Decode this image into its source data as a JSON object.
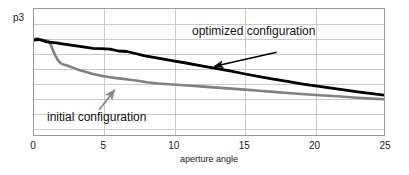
{
  "chart_data": {
    "type": "line",
    "title": "",
    "xlabel": "aperture angle",
    "ylabel": "p3",
    "xlim": [
      0,
      25
    ],
    "ylim": [
      0,
      1
    ],
    "xticks": [
      0,
      5,
      10,
      15,
      20,
      25
    ],
    "xticklabels": [
      "0",
      "5",
      "10",
      "15",
      "20",
      "25"
    ],
    "yticklabels": [],
    "grid": "both",
    "legend": "annotations-with-arrows",
    "series": [
      {
        "name": "optimized configuration",
        "color": "#000000",
        "x": [
          0.0,
          0.3,
          0.6,
          0.9,
          1.2,
          1.6,
          2.0,
          2.5,
          3.0,
          3.6,
          4.2,
          4.8,
          5.4,
          6.0,
          6.6,
          7.2,
          7.8,
          8.5,
          9.2,
          10.0,
          10.8,
          11.6,
          12.4,
          13.2,
          14.0,
          15.0,
          16.0,
          17.0,
          18.0,
          19.0,
          20.0,
          21.0,
          22.0,
          23.0,
          24.0,
          25.0
        ],
        "y": [
          0.756,
          0.762,
          0.755,
          0.744,
          0.74,
          0.735,
          0.728,
          0.72,
          0.712,
          0.702,
          0.693,
          0.69,
          0.686,
          0.672,
          0.668,
          0.652,
          0.636,
          0.622,
          0.608,
          0.592,
          0.578,
          0.562,
          0.546,
          0.53,
          0.514,
          0.492,
          0.472,
          0.452,
          0.434,
          0.416,
          0.4,
          0.384,
          0.368,
          0.352,
          0.338,
          0.326
        ]
      },
      {
        "name": "initial configuration",
        "color": "#808080",
        "x": [
          0.0,
          0.2,
          0.4,
          0.6,
          0.8,
          1.0,
          1.15,
          1.3,
          1.5,
          1.7,
          1.9,
          2.1,
          2.4,
          2.8,
          3.2,
          3.7,
          4.2,
          4.7,
          5.2,
          5.7,
          6.2,
          6.8,
          7.4,
          8.0,
          8.8,
          9.6,
          10.4,
          11.2,
          12.0,
          13.0,
          14.0,
          15.0,
          16.0,
          17.0,
          18.0,
          19.0,
          20.0,
          21.5,
          23.0,
          24.0,
          25.0
        ],
        "y": [
          0.765,
          0.77,
          0.766,
          0.76,
          0.756,
          0.752,
          0.73,
          0.69,
          0.64,
          0.6,
          0.575,
          0.566,
          0.556,
          0.54,
          0.524,
          0.508,
          0.492,
          0.48,
          0.47,
          0.462,
          0.456,
          0.448,
          0.44,
          0.428,
          0.418,
          0.412,
          0.406,
          0.4,
          0.394,
          0.386,
          0.378,
          0.37,
          0.362,
          0.352,
          0.344,
          0.336,
          0.328,
          0.318,
          0.306,
          0.3,
          0.294
        ]
      }
    ],
    "annotations": [
      {
        "text": "optimized configuration",
        "target_series": "optimized configuration",
        "arrow_from": [
          17.3,
          0.655
        ],
        "arrow_to": [
          12.9,
          0.545
        ]
      },
      {
        "text": "initial configuration",
        "target_series": "initial configuration",
        "arrow_from": [
          4.7,
          0.205
        ],
        "arrow_to": [
          5.8,
          0.36
        ]
      }
    ]
  },
  "axis": {
    "y_caption": "p3",
    "x_caption": "aperture angle",
    "x_tick_labels": [
      "0",
      "5",
      "10",
      "15",
      "20",
      "25"
    ]
  },
  "labels": {
    "optimized": "optimized configuration",
    "initial": "initial configuration"
  },
  "colors": {
    "optimized_curve": "#000000",
    "initial_curve": "#808080",
    "grid": "#c9c9c9",
    "frame": "#9a9a9a",
    "background": "#ffffff",
    "text": "#111111"
  }
}
